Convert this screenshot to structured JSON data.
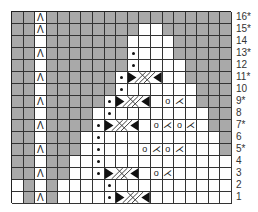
{
  "chart": {
    "columns": 19,
    "rows": 16,
    "colors": {
      "contrast": "#a9a9a9",
      "main": "#ffffff",
      "grid": "#333333"
    },
    "row_labels": [
      "16*",
      "15*",
      "14",
      "13*",
      "12",
      "11*",
      "10",
      "9*",
      "8",
      "7*",
      "6",
      "5*",
      "4",
      "3",
      "2",
      "1"
    ],
    "legend_symbols": {
      "^": "decrease (sk2p / central double decrease)",
      "o": "yarn over",
      "k2tog": "knit 2 together",
      "p": "purl dot",
      "cable": "3-stitch cable cross"
    },
    "grid": [
      {
        "row": 16,
        "gray": [
          0,
          1,
          3,
          4,
          5,
          6,
          7,
          8,
          9,
          10,
          11,
          12,
          13,
          14,
          15,
          16,
          17,
          18
        ],
        "symbols": [
          {
            "col": 2,
            "s": "^"
          }
        ]
      },
      {
        "row": 15,
        "gray": [
          0,
          1,
          3,
          4,
          5,
          6,
          7,
          8,
          9,
          10,
          13,
          14,
          15,
          16,
          17,
          18
        ],
        "symbols": [
          {
            "col": 2,
            "s": "^"
          }
        ]
      },
      {
        "row": 14,
        "gray": [
          0,
          1,
          3,
          4,
          5,
          6,
          7,
          8,
          9,
          14,
          15,
          16,
          17,
          18
        ],
        "symbols": []
      },
      {
        "row": 13,
        "gray": [
          0,
          1,
          3,
          4,
          5,
          6,
          7,
          8,
          9,
          14,
          15,
          16,
          17,
          18
        ],
        "symbols": [
          {
            "col": 2,
            "s": "^"
          },
          {
            "col": 10,
            "s": "p"
          }
        ]
      },
      {
        "row": 12,
        "gray": [
          0,
          1,
          3,
          4,
          5,
          6,
          7,
          8,
          9,
          15,
          16,
          17,
          18
        ],
        "symbols": [
          {
            "col": 10,
            "s": "p"
          }
        ]
      },
      {
        "row": 11,
        "gray": [
          0,
          1,
          3,
          4,
          5,
          6,
          7,
          8,
          15,
          16,
          17,
          18
        ],
        "symbols": [
          {
            "col": 2,
            "s": "^"
          },
          {
            "col": 9,
            "s": "p"
          }
        ],
        "cable": {
          "start": 10,
          "width": 3
        }
      },
      {
        "row": 10,
        "gray": [
          0,
          1,
          3,
          4,
          5,
          6,
          7,
          8,
          16,
          17,
          18
        ],
        "symbols": [
          {
            "col": 9,
            "s": "p"
          }
        ]
      },
      {
        "row": 9,
        "gray": [
          0,
          1,
          3,
          4,
          5,
          6,
          7,
          16,
          17,
          18
        ],
        "symbols": [
          {
            "col": 2,
            "s": "^"
          },
          {
            "col": 8,
            "s": "p"
          },
          {
            "col": 13,
            "s": "o"
          },
          {
            "col": 14,
            "s": "k2tog"
          }
        ],
        "cable": {
          "start": 9,
          "width": 3
        }
      },
      {
        "row": 8,
        "gray": [
          0,
          1,
          3,
          4,
          5,
          6,
          17,
          18
        ],
        "symbols": [
          {
            "col": 8,
            "s": "p"
          }
        ]
      },
      {
        "row": 7,
        "gray": [
          0,
          1,
          3,
          4,
          5,
          6,
          17,
          18
        ],
        "symbols": [
          {
            "col": 2,
            "s": "^"
          },
          {
            "col": 7,
            "s": "p"
          },
          {
            "col": 12,
            "s": "o"
          },
          {
            "col": 13,
            "s": "k2tog"
          },
          {
            "col": 14,
            "s": "o"
          },
          {
            "col": 15,
            "s": "k2tog"
          }
        ],
        "cable": {
          "start": 8,
          "width": 3
        }
      },
      {
        "row": 6,
        "gray": [
          0,
          1,
          3,
          4,
          5,
          18
        ],
        "symbols": [
          {
            "col": 7,
            "s": "p"
          }
        ]
      },
      {
        "row": 5,
        "gray": [
          0,
          1,
          3,
          4,
          5,
          18
        ],
        "symbols": [
          {
            "col": 2,
            "s": "^"
          },
          {
            "col": 7,
            "s": "p"
          },
          {
            "col": 11,
            "s": "o"
          },
          {
            "col": 12,
            "s": "k2tog"
          },
          {
            "col": 13,
            "s": "o"
          },
          {
            "col": 14,
            "s": "k2tog"
          }
        ]
      },
      {
        "row": 4,
        "gray": [
          0,
          1,
          3,
          4
        ],
        "symbols": [
          {
            "col": 7,
            "s": "p"
          }
        ]
      },
      {
        "row": 3,
        "gray": [
          0,
          1,
          3,
          4
        ],
        "symbols": [
          {
            "col": 2,
            "s": "^"
          },
          {
            "col": 7,
            "s": "p"
          },
          {
            "col": 12,
            "s": "o"
          },
          {
            "col": 13,
            "s": "k2tog"
          }
        ],
        "cable": {
          "start": 8,
          "width": 3
        }
      },
      {
        "row": 2,
        "gray": [
          1,
          3
        ],
        "symbols": [
          {
            "col": 8,
            "s": "p"
          }
        ]
      },
      {
        "row": 1,
        "gray": [
          1,
          3
        ],
        "symbols": [
          {
            "col": 2,
            "s": "^"
          },
          {
            "col": 8,
            "s": "p"
          }
        ],
        "cable": {
          "start": 9,
          "width": 3
        }
      }
    ]
  },
  "glyphs": {
    "^": "Λ",
    "o": "o",
    "k2tog": "⋌"
  }
}
